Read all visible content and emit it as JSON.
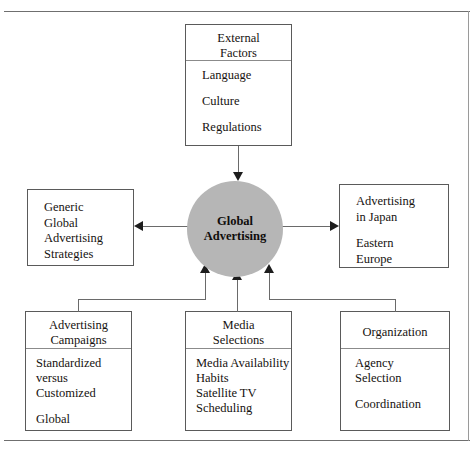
{
  "diagram": {
    "type": "hub-and-spoke concept map",
    "hub": {
      "label": "Global\nAdvertising",
      "shape": "circle",
      "fill": "#b6b6b6"
    },
    "nodes": {
      "external_factors": {
        "header": "External\nFactors",
        "items": [
          "Language",
          "Culture",
          "Regulations"
        ]
      },
      "generic_strategies": {
        "header": "",
        "items": [
          "Generic",
          "Global",
          "Advertising",
          "Strategies"
        ]
      },
      "regional": {
        "header": "",
        "items": [
          "Advertising",
          "in Japan",
          "Eastern",
          "Europe"
        ]
      },
      "advertising_campaigns": {
        "header": "Advertising\nCampaigns",
        "items": [
          "Standardized",
          "versus",
          "Customized",
          "Global"
        ]
      },
      "media_selections": {
        "header": "Media\nSelections",
        "items": [
          "Media Availability",
          "Habits",
          "Satellite TV",
          "Scheduling"
        ]
      },
      "organization": {
        "header": "Organization",
        "items": [
          "Agency",
          "Selection",
          "Coordination"
        ]
      }
    },
    "connectors": [
      {
        "name": "external-factors-to-hub",
        "direction": "down"
      },
      {
        "name": "hub-to-generic-strategies",
        "direction": "left"
      },
      {
        "name": "hub-to-regional",
        "direction": "right"
      },
      {
        "name": "advertising-campaigns-to-hub",
        "direction": "up"
      },
      {
        "name": "media-selections-to-hub",
        "direction": "up"
      },
      {
        "name": "organization-to-hub",
        "direction": "up"
      }
    ],
    "colors": {
      "hub_fill": "#b6b6b6",
      "box_border": "#5a5a5a",
      "connector": "#6a6a6a",
      "arrowhead": "#1d1d1d",
      "background": "#ffffff",
      "text": "#16120f"
    }
  }
}
